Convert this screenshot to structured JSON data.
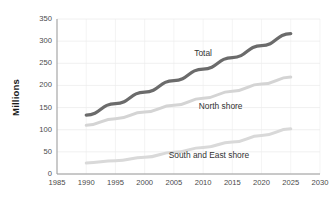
{
  "chart_data": {
    "type": "line",
    "title": "",
    "xlabel": "",
    "ylabel": "Millions",
    "xlim": [
      1985,
      2030
    ],
    "ylim": [
      0,
      350
    ],
    "xticks": [
      1985,
      1990,
      1995,
      2000,
      2005,
      2010,
      2015,
      2020,
      2025,
      2030
    ],
    "yticks": [
      0,
      50,
      100,
      150,
      200,
      250,
      300,
      350
    ],
    "grid": true,
    "legend_position": "inline-annotations",
    "series": [
      {
        "name": "Total",
        "color": "#6b6b6b",
        "width": 3.2,
        "x": [
          1990,
          1995,
          2000,
          2005,
          2010,
          2015,
          2020,
          2025
        ],
        "values": [
          133,
          159,
          185,
          211,
          237,
          263,
          290,
          317
        ]
      },
      {
        "name": "North shore",
        "color": "#d4d4d4",
        "width": 3.0,
        "x": [
          1990,
          1995,
          2000,
          2005,
          2010,
          2015,
          2020,
          2025
        ],
        "values": [
          110,
          125,
          140,
          155,
          171,
          187,
          203,
          219
        ]
      },
      {
        "name": "South and East shore",
        "color": "#d9d9d9",
        "width": 3.0,
        "x": [
          1990,
          1995,
          2000,
          2005,
          2010,
          2015,
          2020,
          2025
        ],
        "values": [
          25,
          30,
          38,
          49,
          60,
          72,
          87,
          102
        ]
      }
    ],
    "annotations": [
      {
        "text": "Total",
        "x": 2010,
        "y": 272
      },
      {
        "text": "North shore",
        "x": 2013,
        "y": 152
      },
      {
        "text": "South and East shore",
        "x": 2011,
        "y": 40
      }
    ]
  },
  "axis": {
    "y_tick_labels": [
      "350",
      "300",
      "250",
      "200",
      "150",
      "100",
      "50",
      "0"
    ],
    "x_tick_labels": [
      "1985",
      "1990",
      "1995",
      "2000",
      "2005",
      "2010",
      "2015",
      "2020",
      "2025",
      "2030"
    ],
    "y_axis_title": "Millions"
  },
  "colors": {
    "total_line": "#6b6b6b",
    "north_shore_line": "#d4d4d4",
    "south_east_shore_line": "#d9d9d9",
    "axis": "#9a9a9a",
    "grid": "#ececec",
    "tick_text": "#4a4a4a",
    "background": "#ffffff"
  }
}
